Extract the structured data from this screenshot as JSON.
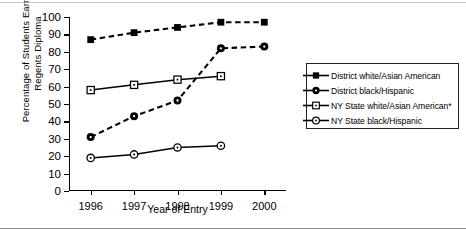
{
  "chart_data": {
    "type": "line",
    "title": "",
    "xlabel": "Year of Entry",
    "ylabel": "Percentage of Students Earning Regents Diploma",
    "ylabel_lines": [
      "Percentage of Students Earning",
      "Regents Diploma"
    ],
    "categories": [
      "1996",
      "1997",
      "1998",
      "1999",
      "2000"
    ],
    "x": [
      1996,
      1997,
      1998,
      1999,
      2000
    ],
    "ylim": [
      0,
      100
    ],
    "yticks": [
      0,
      10,
      20,
      30,
      40,
      50,
      60,
      70,
      80,
      90,
      100
    ],
    "ytick_labels": [
      "0",
      "10",
      "20",
      "30",
      "40",
      "50",
      "60",
      "70",
      "80",
      "90",
      "100"
    ],
    "grid": false,
    "legend_position": "right",
    "series": [
      {
        "name": "District white/Asian American",
        "marker": "filled-square",
        "line": "dashed",
        "values": [
          87,
          91,
          94,
          97,
          97
        ]
      },
      {
        "name": "District black/Hispanic",
        "marker": "filled-circle",
        "line": "dashed",
        "values": [
          31,
          43,
          52,
          82,
          83
        ]
      },
      {
        "name": "NY State white/Asian American*",
        "marker": "open-square",
        "line": "solid",
        "values": [
          58,
          61,
          64,
          66,
          null
        ]
      },
      {
        "name": "NY State black/Hispanic",
        "marker": "open-circle",
        "line": "solid",
        "values": [
          19,
          21,
          25,
          26,
          null
        ]
      }
    ]
  },
  "legend": {
    "items": [
      {
        "label": "District white/Asian American",
        "marker": "filled-square"
      },
      {
        "label": "District black/Hispanic",
        "marker": "filled-circle"
      },
      {
        "label": "NY State white/Asian American*",
        "marker": "open-square"
      },
      {
        "label": "NY State black/Hispanic",
        "marker": "open-circle"
      }
    ]
  },
  "colors": {
    "ink": "#000000",
    "rule": "#8e8e8e",
    "background": "#ffffff"
  }
}
